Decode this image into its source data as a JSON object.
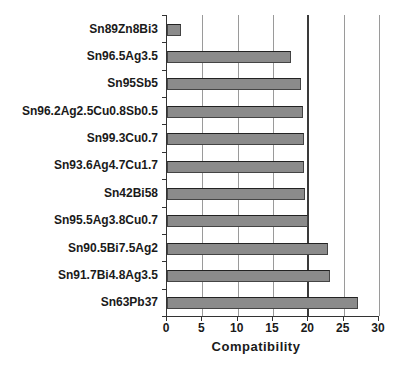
{
  "chart_data": {
    "type": "bar",
    "orientation": "horizontal",
    "title": "",
    "xlabel": "Compatibility",
    "ylabel": "",
    "categories": [
      "Sn89Zn8Bi3",
      "Sn96.5Ag3.5",
      "Sn95Sb5",
      "Sn96.2Ag2.5Cu0.8Sb0.5",
      "Sn99.3Cu0.7",
      "Sn93.6Ag4.7Cu1.7",
      "Sn42Bi58",
      "Sn95.5Ag3.8Cu0.7",
      "Sn90.5Bi7.5Ag2",
      "Sn91.7Bi4.8Ag3.5",
      "Sn63Pb37"
    ],
    "values": [
      2,
      17.5,
      19,
      19.3,
      19.4,
      19.4,
      19.5,
      20,
      22.8,
      23,
      27
    ],
    "xlim": [
      0,
      30
    ],
    "xticks": [
      0,
      5,
      10,
      15,
      20,
      25,
      30
    ],
    "grid": true,
    "emphasized_gridline": 20,
    "legend": null,
    "colors": {
      "bar_fill": "#8b8b8b",
      "bar_border": "#444444",
      "gridline": "#9a9a9a",
      "emphasized_gridline": "#3a3a3a",
      "axis": "#333333",
      "text": "#1a1a1a",
      "background": "#ffffff"
    }
  }
}
